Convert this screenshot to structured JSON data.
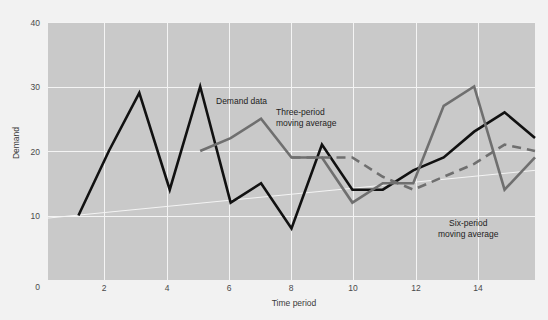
{
  "chart_data": {
    "type": "line",
    "title": "",
    "xlabel": "Time period",
    "ylabel": "Demand",
    "xlim": [
      0,
      16
    ],
    "ylim": [
      0,
      40
    ],
    "grid": true,
    "legend_position": "in-plot annotations",
    "xticks": [
      "2",
      "4",
      "6",
      "8",
      "10",
      "12",
      "14"
    ],
    "xtick_values": [
      2,
      4,
      6,
      8,
      10,
      12,
      14
    ],
    "yticks": [
      "0",
      "10",
      "20",
      "30",
      "40"
    ],
    "ytick_values": [
      0,
      10,
      20,
      30,
      40
    ],
    "series": [
      {
        "name": "Demand data",
        "color": "#111111",
        "style": "solid",
        "width": 2.6,
        "x": [
          1,
          2,
          3,
          4,
          5,
          6,
          7,
          8,
          9,
          10,
          11,
          12,
          13,
          14,
          15,
          16
        ],
        "values": [
          10,
          20,
          29,
          14,
          30,
          12,
          15,
          8,
          21,
          14,
          14,
          17,
          19,
          23,
          26,
          22
        ]
      },
      {
        "name": "Three-period moving average",
        "color": "#6f6f6f",
        "style": "solid",
        "width": 2.6,
        "x": [
          5,
          6,
          7,
          8,
          9,
          10,
          11,
          12,
          13,
          14,
          15,
          16
        ],
        "values": [
          20,
          22,
          25,
          19,
          19,
          12,
          15,
          15,
          27,
          30,
          14,
          19
        ],
        "note": "drawn from period 5 onward"
      },
      {
        "name": "Six-period moving average",
        "color": "#6f6f6f",
        "style": "dashed",
        "width": 2.6,
        "x": [
          8,
          9,
          10,
          11,
          12,
          13,
          14,
          15,
          16
        ],
        "values": [
          19,
          19,
          19,
          16,
          14,
          16,
          18,
          21,
          20
        ],
        "note": "drawn from period 8 onward"
      },
      {
        "name": "Trend line",
        "color": "#f4f4f4",
        "style": "solid",
        "width": 1,
        "x": [
          0,
          16
        ],
        "values": [
          9.6,
          17.0
        ]
      }
    ],
    "annotations": [
      {
        "text": "Demand data",
        "x": 5,
        "y": 33
      },
      {
        "text": "Three-period",
        "x": 7,
        "y": 30.5
      },
      {
        "text": "moving average",
        "x": 7,
        "y": 29
      },
      {
        "text": "Six-period",
        "x": 12.2,
        "y": 11.5
      },
      {
        "text": "moving average",
        "x": 12.2,
        "y": 10
      }
    ],
    "colors": {
      "plot_background": "#c9c9c9",
      "page_background": "#f2f2f2",
      "gridline": "#f4f4f4",
      "demand_line": "#111111",
      "moving_average_line": "#6f6f6f",
      "tick_label": "#4a4a4a"
    }
  },
  "labels": {
    "y_axis_title": "Demand",
    "x_axis_title": "Time period",
    "annot_demand": "Demand data",
    "annot_three_line1": "Three-period",
    "annot_three_line2": "moving average",
    "annot_six_line1": "Six-period",
    "annot_six_line2": "moving average",
    "ytick_0": "0",
    "ytick_10": "10",
    "ytick_20": "20",
    "ytick_30": "30",
    "ytick_40": "40",
    "xtick_2": "2",
    "xtick_4": "4",
    "xtick_6": "6",
    "xtick_8": "8",
    "xtick_10": "10",
    "xtick_12": "12",
    "xtick_14": "14"
  }
}
